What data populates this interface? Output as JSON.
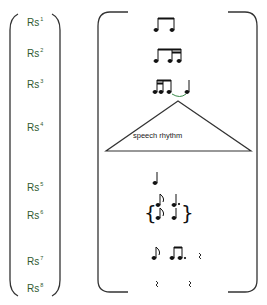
{
  "labels": [
    {
      "base": "Rs",
      "sup": "1"
    },
    {
      "base": "Rs",
      "sup": "2"
    },
    {
      "base": "Rs",
      "sup": "3"
    },
    {
      "base": "Rs",
      "sup": "4"
    },
    {
      "base": "Rs",
      "sup": "5"
    },
    {
      "base": "Rs",
      "sup": "6"
    },
    {
      "base": "Rs",
      "sup": "7"
    },
    {
      "base": "Rs",
      "sup": "8"
    }
  ],
  "triangle_label": "speech rhythm",
  "rows": [
    {
      "id": "Rs1",
      "notation": "two beamed eighth notes"
    },
    {
      "id": "Rs2",
      "notation": "eighth + two sixteenths beamed"
    },
    {
      "id": "Rs3",
      "notation": "two sixteenths + eighth beamed, tied to quarter"
    },
    {
      "id": "Rs4",
      "notation": "speech rhythm"
    },
    {
      "id": "Rs5",
      "notation": "quarter note"
    },
    {
      "id": "Rs6",
      "notation": "{eighth/eighth, dotted quarter/quarter}"
    },
    {
      "id": "Rs7",
      "notation": "eighth, dotted-eighth + sixteenth beamed, rest"
    },
    {
      "id": "Rs8",
      "notation": "rest, rest"
    }
  ],
  "colors": {
    "label": "#2f5a2f",
    "line": "#333333",
    "tie": "#3a8a4a"
  }
}
